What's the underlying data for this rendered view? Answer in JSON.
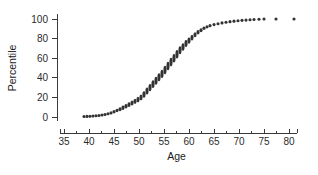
{
  "chart_data": {
    "type": "scatter",
    "title": "",
    "xlabel": "Age",
    "ylabel": "Percentile",
    "xlim": [
      34,
      83
    ],
    "ylim": [
      -3,
      104
    ],
    "grid": false,
    "legend": null,
    "marker_color": "#333333",
    "axis_color": "#3a3a3a",
    "xticks": [
      35,
      40,
      45,
      50,
      55,
      60,
      65,
      70,
      75,
      80
    ],
    "xtick_labels": [
      "35",
      "40",
      "45",
      "50",
      "55",
      "60",
      "65",
      "70",
      "75",
      "80"
    ],
    "xminor_ticks": [
      37.5,
      42.5,
      47.5,
      52.5,
      57.5,
      62.5,
      67.5,
      72.5,
      77.5
    ],
    "yticks": [
      0,
      20,
      40,
      60,
      80,
      100
    ],
    "ytick_labels": [
      "0",
      "20",
      "40",
      "60",
      "80",
      "100"
    ],
    "x": [
      39.0,
      39.6,
      40.2,
      40.8,
      41.4,
      42.0,
      42.6,
      43.2,
      43.8,
      44.4,
      45.0,
      45.6,
      46.2,
      46.8,
      47.4,
      48.0,
      48.6,
      49.2,
      49.8,
      50.4,
      51.0,
      51.6,
      52.2,
      52.8,
      53.4,
      54.0,
      54.6,
      55.2,
      55.8,
      56.4,
      57.0,
      57.6,
      58.2,
      58.8,
      59.4,
      60.0,
      60.6,
      61.2,
      61.8,
      62.4,
      63.0,
      63.6,
      64.2,
      65.0,
      65.8,
      66.6,
      67.4,
      68.2,
      69.0,
      69.8,
      70.6,
      71.4,
      72.2,
      73.0,
      74.0,
      75.0,
      77.4,
      81.0
    ],
    "y": [
      0.5,
      0.6,
      0.8,
      1.0,
      1.3,
      1.6,
      2.0,
      2.6,
      3.3,
      4.2,
      5.3,
      6.6,
      8.0,
      9.5,
      11.0,
      12.6,
      14.3,
      16.0,
      17.8,
      20.0,
      23.0,
      26.5,
      30.0,
      33.5,
      37.0,
      40.5,
      44.0,
      48.0,
      52.0,
      56.0,
      60.0,
      64.0,
      68.0,
      71.5,
      75.0,
      78.0,
      81.0,
      84.0,
      86.5,
      88.5,
      90.5,
      92.0,
      93.2,
      94.3,
      95.2,
      96.0,
      96.7,
      97.3,
      97.8,
      98.2,
      98.6,
      98.9,
      99.2,
      99.5,
      99.7,
      100.0,
      100.0,
      100.0
    ],
    "marker_height": [
      3.0,
      3.0,
      3.0,
      3.0,
      3.0,
      3.0,
      3.0,
      3.0,
      3.0,
      3.2,
      3.4,
      3.6,
      4.0,
      4.4,
      4.6,
      4.8,
      5.0,
      5.2,
      5.4,
      5.8,
      6.4,
      7.0,
      7.4,
      7.6,
      7.8,
      8.0,
      8.2,
      8.4,
      8.6,
      8.6,
      8.6,
      8.4,
      8.0,
      7.4,
      6.8,
      6.2,
      5.6,
      5.0,
      4.4,
      4.0,
      3.6,
      3.4,
      3.2,
      3.0,
      3.0,
      3.0,
      3.0,
      3.0,
      3.0,
      3.0,
      3.0,
      3.0,
      3.0,
      3.0,
      3.0,
      3.0,
      3.0,
      3.0
    ]
  },
  "axes": {
    "x_title": "Age",
    "y_title": "Percentile"
  }
}
